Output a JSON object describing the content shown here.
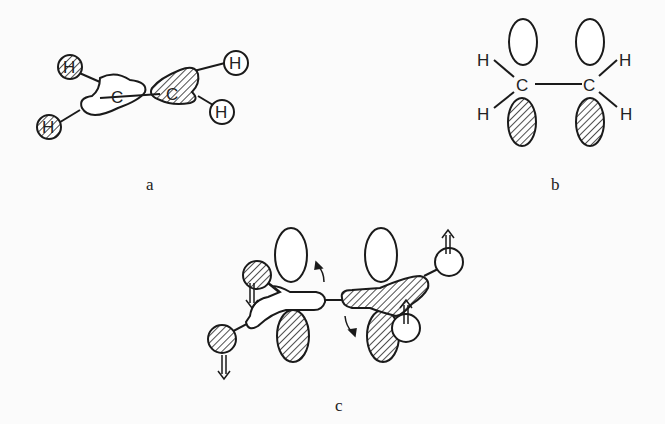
{
  "panels": {
    "a": {
      "label": "a",
      "atoms": {
        "c1": "C",
        "c2": "C",
        "h1": "H",
        "h2": "H",
        "h3": "H",
        "h4": "H"
      }
    },
    "b": {
      "label": "b",
      "atoms": {
        "c1": "C",
        "c2": "C",
        "h1": "H",
        "h2": "H",
        "h3": "H",
        "h4": "H"
      }
    },
    "c": {
      "label": "c"
    }
  },
  "colors": {
    "stroke": "#1a1a1a",
    "background": "#fbfbfb"
  }
}
